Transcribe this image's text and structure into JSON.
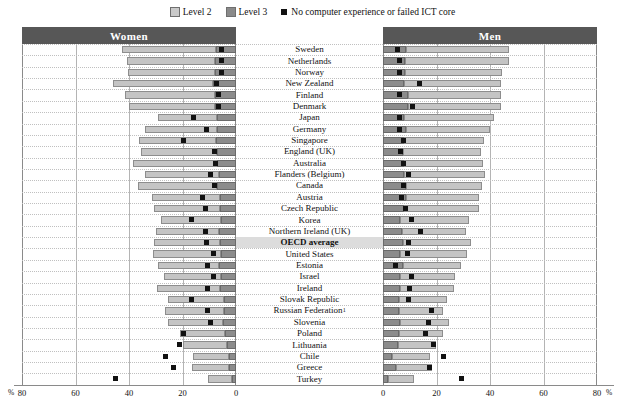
{
  "legend": {
    "items": [
      {
        "key": "level2",
        "label": "Level 2",
        "color": "#c4c4c4"
      },
      {
        "key": "level3",
        "label": "Level 3",
        "color": "#8c8c8c"
      },
      {
        "key": "nocomp",
        "label": "No computer experience or failed ICT core",
        "color": "#111111"
      }
    ]
  },
  "panels": {
    "women": "Women",
    "men": "Men"
  },
  "axis": {
    "unit_left": "%",
    "unit_right": "%",
    "left_ticks": [
      "80",
      "60",
      "40",
      "20",
      "0"
    ],
    "right_ticks": [
      "0",
      "20",
      "40",
      "60",
      "80"
    ],
    "max": 80
  },
  "highlight_row": "OECD average",
  "chart_data": {
    "type": "bar",
    "orientation": "horizontal-diverging",
    "title": "",
    "xlabel": "%",
    "ylabel": "",
    "xlim": [
      0,
      80
    ],
    "grid": true,
    "legend_position": "top-center",
    "series": [
      "Level 2",
      "Level 3",
      "No computer experience or failed ICT core"
    ],
    "categories": [
      "Sweden",
      "Netherlands",
      "Norway",
      "New Zealand",
      "Finland",
      "Denmark",
      "Japan",
      "Germany",
      "Singapore",
      "England (UK)",
      "Australia",
      "Flanders (Belgium)",
      "Canada",
      "Austria",
      "Czech Republic",
      "Korea",
      "Northern Ireland (UK)",
      "OECD average",
      "United States",
      "Estonia",
      "Israel",
      "Ireland",
      "Slovak Republic",
      "Russian Federation",
      "Slovenia",
      "Poland",
      "Lithuania",
      "Chile",
      "Greece",
      "Turkey"
    ],
    "rows": [
      {
        "name": "Sweden",
        "note": "",
        "w_l2": 35.0,
        "w_l3": 7.5,
        "w_nc": 5.3,
        "m_l2": 38.5,
        "m_l3": 8.5,
        "m_nc": 5.5
      },
      {
        "name": "Netherlands",
        "note": "",
        "w_l2": 33.0,
        "w_l3": 7.7,
        "w_nc": 5.5,
        "m_l2": 39.0,
        "m_l3": 8.2,
        "m_nc": 6.0
      },
      {
        "name": "Norway",
        "note": "",
        "w_l2": 32.5,
        "w_l3": 7.7,
        "w_nc": 5.6,
        "m_l2": 36.0,
        "m_l3": 8.4,
        "m_nc": 6.1
      },
      {
        "name": "New Zealand",
        "note": "",
        "w_l2": 37.5,
        "w_l3": 8.5,
        "w_nc": 7.3,
        "m_l2": 36.0,
        "m_l3": 8.0,
        "m_nc": 13.5
      },
      {
        "name": "Finland",
        "note": "",
        "w_l2": 33.5,
        "w_l3": 8.0,
        "w_nc": 6.5,
        "m_l2": 34.5,
        "m_l3": 9.5,
        "m_nc": 6.0
      },
      {
        "name": "Denmark",
        "note": "",
        "w_l2": 32.0,
        "w_l3": 8.0,
        "w_nc": 6.4,
        "m_l2": 34.5,
        "m_l3": 9.5,
        "m_nc": 11.0
      },
      {
        "name": "Japan",
        "note": "",
        "w_l2": 22.0,
        "w_l3": 7.0,
        "w_nc": 16.0,
        "m_l2": 33.5,
        "m_l3": 8.0,
        "m_nc": 6.2
      },
      {
        "name": "Germany",
        "note": "",
        "w_l2": 27.0,
        "w_l3": 7.0,
        "w_nc": 11.0,
        "m_l2": 31.5,
        "m_l3": 8.6,
        "m_nc": 6.3
      },
      {
        "name": "Singapore",
        "note": "",
        "w_l2": 28.5,
        "w_l3": 7.6,
        "w_nc": 19.5,
        "m_l2": 30.0,
        "m_l3": 7.8,
        "m_nc": 7.5
      },
      {
        "name": "England (UK)",
        "note": "",
        "w_l2": 28.5,
        "w_l3": 7.0,
        "w_nc": 8.0,
        "m_l2": 29.0,
        "m_l3": 7.5,
        "m_nc": 6.5
      },
      {
        "name": "Australia",
        "note": "",
        "w_l2": 31.5,
        "w_l3": 7.0,
        "w_nc": 7.5,
        "m_l2": 29.5,
        "m_l3": 8.0,
        "m_nc": 7.5
      },
      {
        "name": "Flanders (Belgium)",
        "note": "",
        "w_l2": 27.5,
        "w_l3": 6.5,
        "w_nc": 9.5,
        "m_l2": 30.0,
        "m_l3": 8.0,
        "m_nc": 9.5
      },
      {
        "name": "Canada",
        "note": "",
        "w_l2": 29.5,
        "w_l3": 7.0,
        "w_nc": 8.0,
        "m_l2": 28.5,
        "m_l3": 8.5,
        "m_nc": 7.5
      },
      {
        "name": "Austria",
        "note": "",
        "w_l2": 25.5,
        "w_l3": 6.0,
        "w_nc": 12.5,
        "m_l2": 27.5,
        "m_l3": 8.5,
        "m_nc": 6.8
      },
      {
        "name": "Czech Republic",
        "note": "",
        "w_l2": 24.5,
        "w_l3": 6.0,
        "w_nc": 11.5,
        "m_l2": 28.0,
        "m_l3": 8.0,
        "m_nc": 8.5
      },
      {
        "name": "Korea",
        "note": "",
        "w_l2": 22.5,
        "w_l3": 5.5,
        "w_nc": 16.5,
        "m_l2": 25.5,
        "m_l3": 6.5,
        "m_nc": 10.5
      },
      {
        "name": "Northern Ireland (UK)",
        "note": "",
        "w_l2": 23.5,
        "w_l3": 6.5,
        "w_nc": 11.5,
        "m_l2": 24.0,
        "m_l3": 7.0,
        "m_nc": 14.0
      },
      {
        "name": "OECD average",
        "note": "",
        "w_l2": 24.5,
        "w_l3": 6.0,
        "w_nc": 11.0,
        "m_l2": 25.5,
        "m_l3": 7.5,
        "m_nc": 9.5
      },
      {
        "name": "United States",
        "note": "",
        "w_l2": 25.5,
        "w_l3": 5.5,
        "w_nc": 8.5,
        "m_l2": 25.0,
        "m_l3": 6.5,
        "m_nc": 9.0
      },
      {
        "name": "Estonia",
        "note": "",
        "w_l2": 22.5,
        "w_l3": 6.5,
        "w_nc": 10.5,
        "m_l2": 21.5,
        "m_l3": 7.5,
        "m_nc": 4.5
      },
      {
        "name": "Israel",
        "note": "",
        "w_l2": 21.5,
        "w_l3": 5.5,
        "w_nc": 8.5,
        "m_l2": 20.5,
        "m_l3": 6.5,
        "m_nc": 10.5
      },
      {
        "name": "Ireland",
        "note": "",
        "w_l2": 23.5,
        "w_l3": 6.0,
        "w_nc": 10.5,
        "m_l2": 20.0,
        "m_l3": 6.5,
        "m_nc": 10.0
      },
      {
        "name": "Slovak Republic",
        "note": "",
        "w_l2": 21.0,
        "w_l3": 4.5,
        "w_nc": 16.5,
        "m_l2": 18.0,
        "m_l3": 6.0,
        "m_nc": 9.5
      },
      {
        "name": "Russian Federation",
        "note": "1",
        "w_l2": 22.0,
        "w_l3": 4.5,
        "w_nc": 10.5,
        "m_l2": 16.5,
        "m_l3": 6.0,
        "m_nc": 18.0
      },
      {
        "name": "Slovenia",
        "note": "",
        "w_l2": 20.5,
        "w_l3": 5.0,
        "w_nc": 9.5,
        "m_l2": 18.0,
        "m_l3": 6.5,
        "m_nc": 17.0
      },
      {
        "name": "Poland",
        "note": "",
        "w_l2": 17.0,
        "w_l3": 4.0,
        "w_nc": 19.5,
        "m_l2": 16.5,
        "m_l3": 6.0,
        "m_nc": 16.0
      },
      {
        "name": "Lithuania",
        "note": "",
        "w_l2": 16.5,
        "w_l3": 3.5,
        "w_nc": 21.0,
        "m_l2": 14.5,
        "m_l3": 5.5,
        "m_nc": 19.0
      },
      {
        "name": "Chile",
        "note": "",
        "w_l2": 13.5,
        "w_l3": 2.5,
        "w_nc": 26.5,
        "m_l2": 14.0,
        "m_l3": 3.5,
        "m_nc": 22.5
      },
      {
        "name": "Greece",
        "note": "",
        "w_l2": 14.0,
        "w_l3": 2.5,
        "w_nc": 23.5,
        "m_l2": 13.5,
        "m_l3": 5.0,
        "m_nc": 17.5
      },
      {
        "name": "Turkey",
        "note": "",
        "w_l2": 9.0,
        "w_l3": 1.5,
        "w_nc": 45.0,
        "m_l2": 9.5,
        "m_l3": 2.0,
        "m_nc": 29.5
      }
    ]
  }
}
